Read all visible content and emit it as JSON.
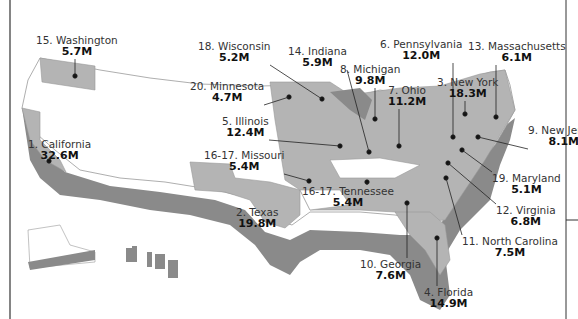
{
  "map": {
    "colors": {
      "highlight": "#b4b4b4",
      "shadow": "#8a8a8a",
      "plain": "#ffffff",
      "border": "#999999",
      "text": "#222222"
    },
    "states": [
      {
        "rank": "1.",
        "name": "California",
        "value": "32.6M",
        "x": 28,
        "y": 138,
        "dot": [
          49,
          161
        ]
      },
      {
        "rank": "2.",
        "name": "Texas",
        "value": "19.8M",
        "x": 236,
        "y": 206,
        "dot": null
      },
      {
        "rank": "3.",
        "name": "New York",
        "value": "18.3M",
        "x": 437,
        "y": 76,
        "dot": [
          465,
          114
        ]
      },
      {
        "rank": "4.",
        "name": "Florida",
        "value": "14.9M",
        "x": 424,
        "y": 286,
        "dot": [
          437,
          238
        ]
      },
      {
        "rank": "5.",
        "name": "Illinois",
        "value": "12.4M",
        "x": 222,
        "y": 115,
        "dot": [
          340,
          146
        ]
      },
      {
        "rank": "6.",
        "name": "Pennsylvania",
        "value": "12.0M",
        "x": 380,
        "y": 38,
        "dot": [
          453,
          137
        ]
      },
      {
        "rank": "7.",
        "name": "Ohio",
        "value": "11.2M",
        "x": 388,
        "y": 84,
        "dot": [
          399,
          146
        ]
      },
      {
        "rank": "8.",
        "name": "Michigan",
        "value": "9.8M",
        "x": 340,
        "y": 63,
        "dot": [
          375,
          119
        ]
      },
      {
        "rank": "9.",
        "name": "New Jersey",
        "value": "8.1M",
        "x": 528,
        "y": 124,
        "dot": [
          478,
          137
        ]
      },
      {
        "rank": "10.",
        "name": "Georgia",
        "value": "7.6M",
        "x": 360,
        "y": 258,
        "dot": [
          407,
          203
        ]
      },
      {
        "rank": "11.",
        "name": "North Carolina",
        "value": "7.5M",
        "x": 462,
        "y": 235,
        "dot": [
          446,
          178
        ]
      },
      {
        "rank": "12.",
        "name": "Virginia",
        "value": "6.8M",
        "x": 496,
        "y": 204,
        "dot": [
          448,
          163
        ]
      },
      {
        "rank": "13.",
        "name": "Massachusetts",
        "value": "6.1M",
        "x": 468,
        "y": 40,
        "dot": [
          496,
          117
        ]
      },
      {
        "rank": "14.",
        "name": "Indiana",
        "value": "5.9M",
        "x": 288,
        "y": 45,
        "dot": [
          369,
          152
        ]
      },
      {
        "rank": "15.",
        "name": "Washington",
        "value": "5.7M",
        "x": 36,
        "y": 34,
        "dot": [
          75,
          76
        ]
      },
      {
        "rank": "16-17.",
        "name": "Missouri",
        "value": "5.4M",
        "x": 204,
        "y": 149,
        "dot": [
          309,
          181
        ]
      },
      {
        "rank": "16-17.",
        "name": "Tennessee",
        "value": "5.4M",
        "x": 302,
        "y": 185,
        "dot": [
          367,
          182
        ]
      },
      {
        "rank": "18.",
        "name": "Wisconsin",
        "value": "5.2M",
        "x": 198,
        "y": 40,
        "dot": [
          322,
          99
        ]
      },
      {
        "rank": "19.",
        "name": "Maryland",
        "value": "5.1M",
        "x": 492,
        "y": 172,
        "dot": [
          462,
          150
        ]
      },
      {
        "rank": "20.",
        "name": "Minnesota",
        "value": "4.7M",
        "x": 190,
        "y": 80,
        "dot": [
          289,
          97
        ]
      }
    ]
  }
}
